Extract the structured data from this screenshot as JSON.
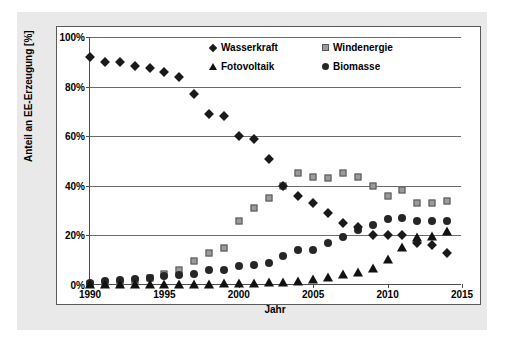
{
  "chart_data": {
    "type": "scatter",
    "title": "",
    "xlabel": "Jahr",
    "ylabel": "Anteil an EE-Erzeugung [%]",
    "xlim": [
      1990,
      2015
    ],
    "ylim": [
      0,
      100
    ],
    "xticks": [
      1990,
      1995,
      2000,
      2005,
      2010,
      2015
    ],
    "xtick_labels": [
      "1990",
      "1995",
      "2000",
      "2005",
      "2010",
      "2015"
    ],
    "yticks": [
      0,
      20,
      40,
      60,
      80,
      100
    ],
    "ytick_labels": [
      "0%",
      "20%",
      "40%",
      "60%",
      "80%",
      "100%"
    ],
    "grid": "horizontal",
    "legend_position": "top-right-inside",
    "x": [
      1990,
      1991,
      1992,
      1993,
      1994,
      1995,
      1996,
      1997,
      1998,
      1999,
      2000,
      2001,
      2002,
      2003,
      2004,
      2005,
      2006,
      2007,
      2008,
      2009,
      2010,
      2011,
      2012,
      2013,
      2014
    ],
    "series": [
      {
        "name": "Wasserkraft",
        "marker": "diamond",
        "color": "#1a1a1a",
        "values": [
          92,
          90,
          90,
          88.5,
          87.5,
          86,
          84,
          77,
          69,
          68,
          60,
          59,
          51,
          40,
          36,
          33,
          29,
          25,
          23.5,
          20,
          20,
          20,
          17,
          16,
          13
        ]
      },
      {
        "name": "Windenergie",
        "marker": "square",
        "color": "#9a9a9a",
        "values": [
          0.5,
          0.7,
          1,
          1.5,
          3,
          4.5,
          6,
          9.5,
          13,
          15,
          26,
          31,
          35,
          40,
          45,
          43.5,
          43,
          45,
          43.5,
          40,
          36,
          38.5,
          33,
          33,
          34
        ]
      },
      {
        "name": "Fotovoltaik",
        "marker": "triangle",
        "color": "#111111",
        "values": [
          0,
          0,
          0,
          0,
          0,
          0,
          0,
          0.2,
          0.2,
          0.3,
          0.4,
          0.5,
          0.7,
          1,
          1.3,
          2,
          3,
          4,
          5,
          6.5,
          10,
          15,
          19,
          19.5,
          21.5
        ]
      },
      {
        "name": "Biomasse",
        "marker": "circle",
        "color": "#262626",
        "values": [
          1,
          1.5,
          2,
          2.5,
          3,
          3.5,
          4,
          4.5,
          6,
          6,
          7.5,
          8,
          9,
          11.5,
          14,
          14,
          17,
          19.5,
          22,
          24,
          26.5,
          27,
          26,
          26,
          26
        ]
      }
    ]
  },
  "axes": {
    "x_title": "Jahr",
    "y_title": "Anteil an EE-Erzeugung [%]"
  },
  "legend": {
    "items": [
      {
        "label": "Wasserkraft",
        "marker": "diamond-icon"
      },
      {
        "label": "Windenergie",
        "marker": "square-icon"
      },
      {
        "label": "Fotovoltaik",
        "marker": "triangle-icon"
      },
      {
        "label": "Biomasse",
        "marker": "circle-icon"
      }
    ]
  }
}
